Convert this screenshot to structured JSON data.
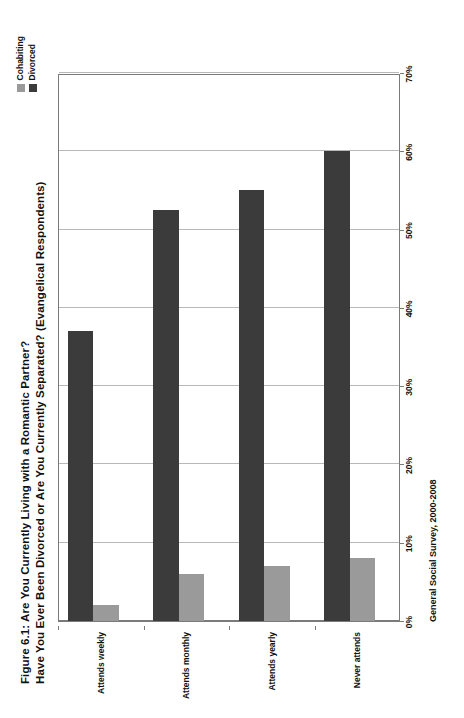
{
  "figure": {
    "title_lines": [
      "Figure 6.1: Are You Currently Living with a Romantic Partner?",
      "Have You Ever Been Divorced or Are You Currently Separated? (Evangelical Respondents)"
    ],
    "source_note": "General Social Survey, 2000-2008"
  },
  "legend": {
    "entries": [
      {
        "label": "Cohabiting",
        "color": "#9a9a9a"
      },
      {
        "label": "Divorced",
        "color": "#3b3b3b"
      }
    ]
  },
  "axis": {
    "value_ticks": [
      "0%",
      "10%",
      "20%",
      "30%",
      "40%",
      "50%",
      "60%",
      "70%"
    ],
    "value_tick_numbers": [
      0,
      10,
      20,
      30,
      40,
      50,
      60,
      70
    ]
  },
  "chart_data": {
    "type": "bar",
    "orientation": "horizontal",
    "title": "Figure 6.1: Are You Currently Living with a Romantic Partner? Have You Ever Been Divorced or Are You Currently Separated? (Evangelical Respondents)",
    "xlabel": "",
    "ylabel": "",
    "xlim": [
      0,
      70
    ],
    "grid": true,
    "legend_position": "top-right",
    "categories": [
      "Never attends",
      "Attends yearly",
      "Attends monthly",
      "Attends weekly"
    ],
    "series": [
      {
        "name": "Cohabiting",
        "color": "#9a9a9a",
        "values": [
          8,
          7,
          6,
          2
        ]
      },
      {
        "name": "Divorced",
        "color": "#3b3b3b",
        "values": [
          60,
          55,
          52.5,
          37
        ]
      }
    ],
    "annotations": [
      "General Social Survey, 2000-2008"
    ]
  }
}
